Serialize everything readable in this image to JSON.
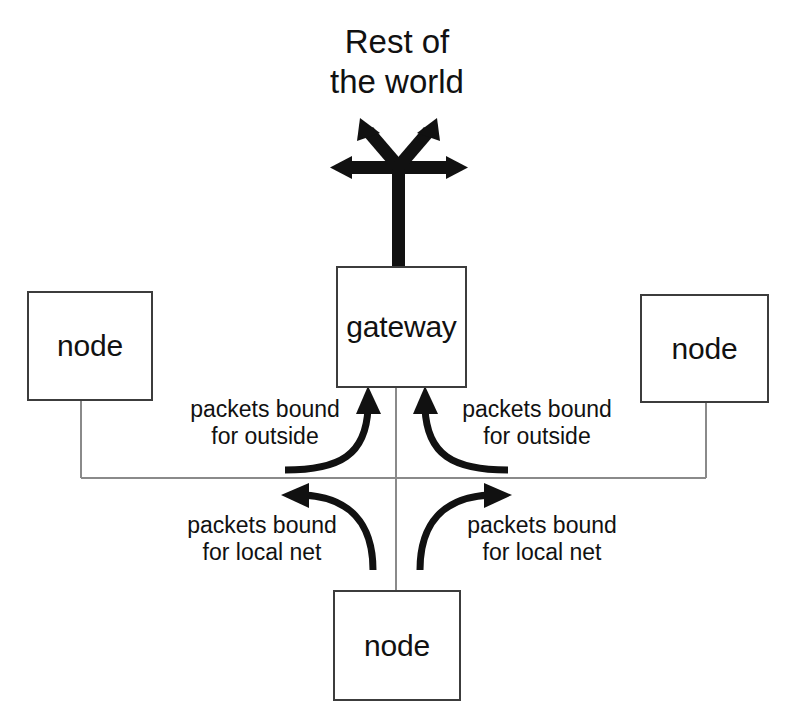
{
  "diagram": {
    "title_lines": [
      "Rest of",
      "the world"
    ],
    "colors": {
      "stroke": "#3c3c3c",
      "arrow": "#111111",
      "text": "#111111",
      "background": "#ffffff"
    },
    "nodes": {
      "gateway": {
        "label": "gateway"
      },
      "node_left": {
        "label": "node"
      },
      "node_right": {
        "label": "node"
      },
      "node_bottom": {
        "label": "node"
      }
    },
    "labels": {
      "outbound_left": {
        "line1": "packets bound",
        "line2": "for outside"
      },
      "outbound_right": {
        "line1": "packets bound",
        "line2": "for outside"
      },
      "local_left": {
        "line1": "packets bound",
        "line2": "for local net"
      },
      "local_right": {
        "line1": "packets bound",
        "line2": "for local net"
      }
    },
    "icons": {
      "world_uplink": "four-way-arrow-icon",
      "flow_up_left": "curved-arrow-up-icon",
      "flow_up_right": "curved-arrow-up-icon",
      "flow_out_left": "curved-arrow-left-icon",
      "flow_out_right": "curved-arrow-right-icon"
    }
  }
}
